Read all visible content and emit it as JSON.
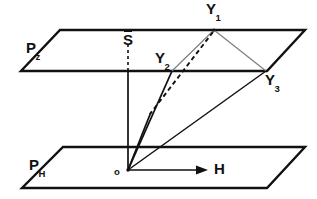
{
  "figure": {
    "type": "geometric-diagram",
    "width": 317,
    "height": 199,
    "background_color": "#ffffff",
    "stroke_color": "#111111",
    "thin_stroke_color": "#555555"
  },
  "labels": {
    "plane_upper": {
      "base": "P",
      "subscript": "z",
      "x": 26,
      "y": 47
    },
    "plane_lower": {
      "base": "P",
      "subscript": "H",
      "x": 29,
      "y": 164
    },
    "s_bar": {
      "text": "S",
      "overbar": true,
      "x": 123,
      "y": 38
    },
    "y1": {
      "base": "Y",
      "subscript": "1",
      "x": 206,
      "y": 3
    },
    "y2": {
      "base": "Y",
      "subscript": "2",
      "x": 155,
      "y": 52
    },
    "y3": {
      "base": "Y",
      "subscript": "3",
      "x": 265,
      "y": 74
    },
    "origin": {
      "text": "o",
      "x": 114,
      "y": 168
    },
    "h_axis": {
      "text": "H",
      "x": 214,
      "y": 160
    }
  },
  "geometry": {
    "plane_upper_points": "60,30 305,30 267,71 21,71",
    "plane_lower_points": "63,147 305,147 267,188 22,188",
    "origin_point": {
      "x": 128,
      "y": 170
    },
    "y1_point": {
      "x": 214,
      "y": 30
    },
    "y2_point": {
      "x": 172,
      "y": 71
    },
    "y3_point": {
      "x": 266,
      "y": 71
    },
    "s_point": {
      "x": 128,
      "y": 71
    },
    "vertical_solid": {
      "x1": 128,
      "y1": 71,
      "x2": 128,
      "y2": 170
    },
    "vertical_dashed": {
      "x1": 128,
      "y1": 45,
      "x2": 128,
      "y2": 70
    },
    "h_arrow": {
      "x1": 128,
      "y1": 170,
      "x2": 205,
      "y2": 170
    },
    "dashed_back_edge": {
      "x1": 110,
      "y1": 147,
      "x2": 158,
      "y2": 147
    },
    "dashed_y1_origin": {
      "x1": 214,
      "y1": 30,
      "x2": 150,
      "y2": 113
    }
  },
  "edges": [
    {
      "name": "origin-to-y1-dashed",
      "style": "dashed"
    },
    {
      "name": "origin-to-y2",
      "style": "solid"
    },
    {
      "name": "origin-to-y3",
      "style": "solid"
    },
    {
      "name": "y2-to-y1",
      "style": "thin"
    },
    {
      "name": "y1-to-y3",
      "style": "thin"
    },
    {
      "name": "origin-to-h",
      "style": "arrow"
    }
  ]
}
